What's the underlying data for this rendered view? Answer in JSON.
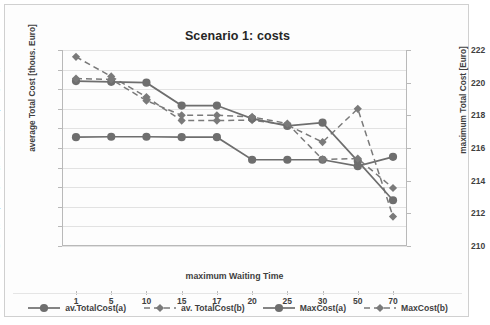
{
  "chart_data": {
    "type": "line",
    "title": "Scenario 1: costs",
    "xlabel": "maximum Waiting Time",
    "ylabel": "average Total Cost [thous. Euro]",
    "ylabel_right": "maximum Total Cost [Euro]",
    "categories": [
      "1",
      "5",
      "10",
      "15",
      "17",
      "20",
      "25",
      "30",
      "50",
      "70"
    ],
    "ylim": [
      100,
      120
    ],
    "yticks": [
      100,
      102,
      104,
      106,
      108,
      110,
      112,
      114,
      116,
      118,
      120
    ],
    "ylim_right": [
      210,
      222
    ],
    "yticks_right": [
      210,
      212,
      214,
      216,
      218,
      220,
      222
    ],
    "grid": true,
    "legend_position": "bottom",
    "series": [
      {
        "name": "av.TotalCost(a)",
        "axis": "left",
        "style": "solid",
        "marker": "circle",
        "color": "#6e6e6e",
        "values": [
          111.1,
          111.15,
          111.15,
          111.1,
          111.1,
          108.8,
          108.8,
          108.8,
          108.15,
          109.1
        ]
      },
      {
        "name": "av. TotalCost(b)",
        "axis": "left",
        "style": "dashed",
        "marker": "diamond",
        "color": "#7a7a7a",
        "values": [
          119.3,
          117.3,
          115.2,
          112.8,
          112.8,
          112.85,
          112.35,
          110.6,
          114.0,
          103.0
        ]
      },
      {
        "name": "MaxCost(a)",
        "axis": "right",
        "style": "solid",
        "marker": "circle",
        "color": "#6e6e6e",
        "values": [
          220.1,
          220.05,
          220.0,
          218.6,
          218.6,
          217.8,
          217.35,
          217.55,
          215.2,
          212.8
        ]
      },
      {
        "name": "MaxCost(b)",
        "axis": "right",
        "style": "dashed",
        "marker": "diamond",
        "color": "#7a7a7a",
        "values": [
          220.25,
          220.2,
          218.9,
          218.0,
          218.0,
          217.9,
          217.5,
          215.3,
          215.35,
          213.55
        ]
      }
    ]
  },
  "legend": {
    "items": [
      {
        "label": "av.TotalCost(a)"
      },
      {
        "label": "av. TotalCost(b)"
      },
      {
        "label": "MaxCost(a)"
      },
      {
        "label": "MaxCost(b)"
      }
    ]
  }
}
